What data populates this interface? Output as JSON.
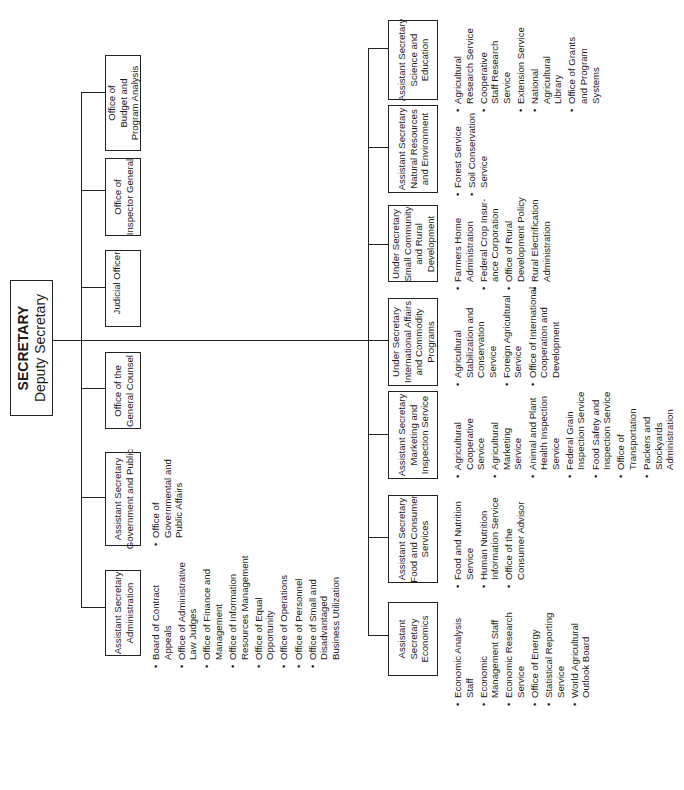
{
  "secretary": {
    "title": "SECRETARY",
    "subtitle": "Deputy Secretary"
  },
  "staff_offices": [
    {
      "id": "budget",
      "lines": [
        "Office of",
        "Budget and",
        "Program Analysis"
      ]
    },
    {
      "id": "inspector",
      "lines": [
        "Office of",
        "Inspector General"
      ]
    },
    {
      "id": "judicial",
      "lines": [
        "Judicial Officer"
      ]
    },
    {
      "id": "counsel",
      "lines": [
        "Office of the",
        "General Counsel"
      ]
    },
    {
      "id": "govpublic",
      "lines": [
        "Assistant Secretary",
        "Government and Public"
      ],
      "items": [
        [
          "Office of",
          "Governmental and",
          "Public Affairs"
        ]
      ]
    },
    {
      "id": "admin",
      "lines": [
        "Assistant Secretary",
        "Administration"
      ],
      "items": [
        [
          "Board of Contract",
          "Appeals"
        ],
        [
          "Office of Administrative",
          "Law Judges"
        ],
        [
          "Office of Finance and",
          "Management"
        ],
        [
          "Office of Information",
          "Resources Management"
        ],
        [
          "Office of Equal",
          "Opportunity"
        ],
        [
          "Office of Operations"
        ],
        [
          "Office of Personnel"
        ],
        [
          "Office of Small and",
          "Disadvantaged",
          "Business Utilization"
        ]
      ]
    }
  ],
  "mission_areas": [
    {
      "id": "scied",
      "lines": [
        "Assistant Secretary",
        "Science and",
        "Education"
      ],
      "items": [
        [
          "Agricultural",
          "Research Service"
        ],
        [
          "Cooperative",
          "Staff Research",
          "Service"
        ],
        [
          "Extension Service"
        ],
        [
          "National",
          "Agricultural",
          "Library"
        ],
        [
          "Office of Grants",
          "and Program",
          "Systems"
        ]
      ]
    },
    {
      "id": "natres",
      "lines": [
        "Assistant Secretary",
        "Natural Resources",
        "and Environment"
      ],
      "items": [
        [
          "Forest Service"
        ],
        [
          "Soil Conservation",
          "Service"
        ]
      ]
    },
    {
      "id": "smallcomm",
      "lines": [
        "Under Secretary",
        "Small Community",
        "and Rural",
        "Development"
      ],
      "items": [
        [
          "Farmers Home",
          "Administration"
        ],
        [
          "Federal Crop Insur-",
          "ance Corporation"
        ],
        [
          "Office of Rural",
          "Development Policy"
        ],
        [
          "Rural Electrification",
          "Administration"
        ]
      ]
    },
    {
      "id": "intl",
      "lines": [
        "Under Secretary",
        "International Affairs",
        "and Commodity",
        "Programs"
      ],
      "items": [
        [
          "Agricultural",
          "Stabilization and",
          "Conservation",
          "Service"
        ],
        [
          "Foreign Agricultural",
          "Service"
        ],
        [
          "Office of International",
          "Cooperation and",
          "Development"
        ]
      ]
    },
    {
      "id": "marketing",
      "lines": [
        "Assistant Secretary",
        "Marketing and",
        "Inspection Service"
      ],
      "items": [
        [
          "Agricultural",
          "Cooperative",
          "Service"
        ],
        [
          "Agricultural",
          "Marketing",
          "Service"
        ],
        [
          "Animal and Plant",
          "Health Inspection",
          "Service"
        ],
        [
          "Federal Grain",
          "Inspection Service"
        ],
        [
          "Food Safety and",
          "Inspection Service"
        ],
        [
          "Office of",
          "Transportation"
        ],
        [
          "Packers and",
          "Stockyards",
          "Administration"
        ]
      ]
    },
    {
      "id": "food",
      "lines": [
        "Assistant Secretary",
        "Food and Consumer",
        "Services"
      ],
      "items": [
        [
          "Food and Nutrition",
          "Service"
        ],
        [
          "Human Nutrition",
          "Information Service"
        ],
        [
          "Office of the",
          "Consumer Advisor"
        ]
      ]
    },
    {
      "id": "econ",
      "lines": [
        "Assistant",
        "Secretary",
        "Economics"
      ],
      "items": [
        [
          "Economic Analysis",
          "Staff"
        ],
        [
          "Economic",
          "Management Staff"
        ],
        [
          "Economic Research",
          "Service"
        ],
        [
          "Office of Energy"
        ],
        [
          "Statistical Reporting",
          "Service"
        ],
        [
          "World Agricultural",
          "Outlook Board"
        ]
      ]
    }
  ]
}
